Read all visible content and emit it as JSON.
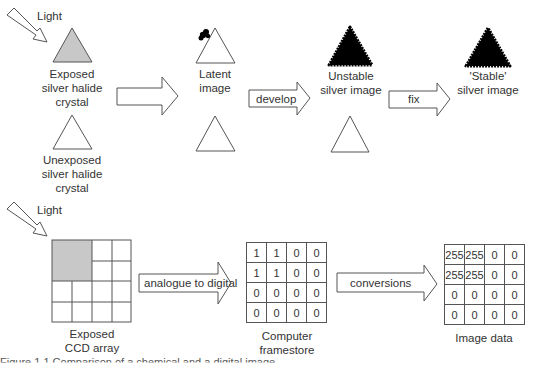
{
  "film_process": {
    "light_label": "Light",
    "exposed_label": [
      "Exposed",
      "silver halide",
      "crystal"
    ],
    "unexposed_label": [
      "Unexposed",
      "silver halide",
      "crystal"
    ],
    "latent_label": [
      "Latent",
      "image"
    ],
    "develop_label": "develop",
    "unstable_label": [
      "Unstable",
      "silver image"
    ],
    "fix_label": "fix",
    "stable_label": [
      "'Stable'",
      "silver image"
    ]
  },
  "digital_process": {
    "light_label": "Light",
    "ccd_label": [
      "Exposed",
      "CCD array"
    ],
    "a2d_label": "analogue to digital",
    "framestore_label": [
      "Computer",
      "framestore"
    ],
    "framestore_values": [
      [
        "1",
        "1",
        "0",
        "0"
      ],
      [
        "1",
        "1",
        "0",
        "0"
      ],
      [
        "0",
        "0",
        "0",
        "0"
      ],
      [
        "0",
        "0",
        "0",
        "0"
      ]
    ],
    "conversions_label": "conversions",
    "image_data_label": "Image data",
    "image_data_values": [
      [
        "255",
        "255",
        "0",
        "0"
      ],
      [
        "255",
        "255",
        "0",
        "0"
      ],
      [
        "0",
        "0",
        "0",
        "0"
      ],
      [
        "0",
        "0",
        "0",
        "0"
      ]
    ]
  },
  "colors": {
    "exposed_fill": "#c8c8c8",
    "silver_fill": "#000000",
    "stroke": "#555555"
  },
  "caption": "Figure 1.1  Comparison of a chemical and a digital image"
}
